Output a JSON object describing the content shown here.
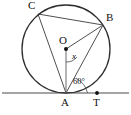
{
  "figure": {
    "type": "circle-geometry-diagram",
    "background_color": "#ffffff",
    "stroke_color": "#333333",
    "label_color": "#111111"
  },
  "labels": {
    "center": "O",
    "point_a": "A",
    "point_b": "B",
    "point_c": "C",
    "point_t": "T",
    "angle_center": "x",
    "angle_tangent": "60°"
  },
  "geometry": {
    "circle": {
      "cx": 66,
      "cy": 49,
      "r": 44
    },
    "points": {
      "O": {
        "x": 66,
        "y": 49
      },
      "A": {
        "x": 66,
        "y": 93
      },
      "B": {
        "x": 103,
        "y": 25
      },
      "C": {
        "x": 38,
        "y": 14
      },
      "T": {
        "x": 97,
        "y": 93
      }
    },
    "tangent_line": {
      "x1": 2,
      "y1": 93,
      "x2": 129,
      "y2": 93
    },
    "segments": [
      {
        "name": "AB",
        "from": "A",
        "to": "B"
      },
      {
        "name": "AC",
        "from": "A",
        "to": "C"
      },
      {
        "name": "CB",
        "from": "C",
        "to": "B"
      },
      {
        "name": "OA",
        "from": "O",
        "to": "A"
      },
      {
        "name": "OB",
        "from": "O",
        "to": "B"
      }
    ],
    "angle_marks": [
      {
        "name": "angle-x-at-O",
        "vertex": "O",
        "value_label": "x"
      },
      {
        "name": "angle-60-at-A",
        "vertex": "A",
        "value_label": "60°"
      }
    ]
  }
}
